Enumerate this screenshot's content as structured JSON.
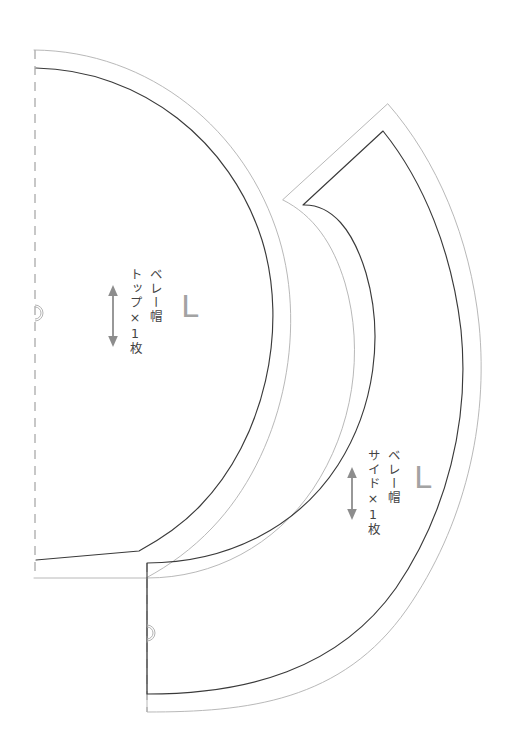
{
  "document": {
    "kind": "sewing-pattern-sheet",
    "background_color": "#ffffff",
    "width": 520,
    "height": 751
  },
  "line_colors": {
    "seam_allowance": "#b0b0b0",
    "finished_line": "#3a3a3a",
    "fold_line": "#9a9a9a",
    "notch": "#b3b3b3",
    "grain_arrow": "#8d8d8d",
    "text": "#434343",
    "size_letter": "#a3a3a3"
  },
  "pieces": [
    {
      "id": "top-piece",
      "name": "beret-top-piece",
      "garment_label": "ベレー帽",
      "part_label": "トップ×1枚",
      "size_label": "L",
      "shape": "quarter-circle-on-fold",
      "has_fold_line": true,
      "has_notch": true,
      "grain_arrow": "vertical double-headed"
    },
    {
      "id": "side-piece",
      "name": "beret-side-piece",
      "garment_label": "ベレー帽",
      "part_label": "サイド×1枚",
      "size_label": "L",
      "shape": "curved-band-on-fold",
      "has_fold_line": true,
      "has_notch": true,
      "grain_arrow": "vertical double-headed"
    }
  ],
  "top_piece": {
    "garment_label": "ベレー帽",
    "part_label": "トップ×1枚",
    "size_label": "L"
  },
  "side_piece": {
    "garment_label": "ベレー帽",
    "part_label": "サイド×1枚",
    "size_label": "L"
  }
}
